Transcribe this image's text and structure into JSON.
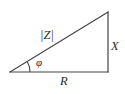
{
  "figure": {
    "type": "geometry-diagram",
    "background_color": "#ffffff",
    "line_color": "#444444",
    "text_color": "#2b2b2b",
    "labels": {
      "hypotenuse": "|Z|",
      "vertical_leg": "X",
      "horizontal_leg": "R",
      "angle": "φ"
    },
    "geometry": {
      "left_vertex": [
        10,
        72
      ],
      "right_angle_vertex": [
        108,
        72
      ],
      "top_vertex": [
        108,
        12
      ],
      "angle_arc_radius": 20
    }
  }
}
